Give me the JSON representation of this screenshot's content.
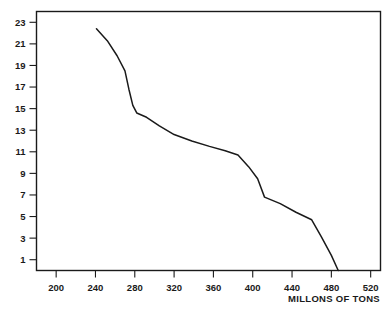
{
  "chart_data": {
    "type": "line",
    "title": "",
    "subtitle": "",
    "xlabel": "MILLONS OF TONS",
    "ylabel": "",
    "xlim": [
      180,
      530
    ],
    "ylim": [
      0,
      24
    ],
    "grid": false,
    "legend": null,
    "x_ticks": [
      200,
      240,
      280,
      320,
      360,
      400,
      440,
      480,
      520
    ],
    "x_tick_labels": [
      "200",
      "240",
      "280",
      "320",
      "360",
      "400",
      "440",
      "480",
      "520"
    ],
    "y_ticks": [
      23,
      21,
      19,
      17,
      15,
      13,
      11,
      9,
      7,
      5,
      3,
      1
    ],
    "y_tick_labels": [
      "23",
      "21",
      "19",
      "17",
      "15",
      "13",
      "11",
      "9",
      "7",
      "5",
      "3",
      "1"
    ],
    "series": [
      {
        "name": "curve",
        "color": "#1a1a1a",
        "points": [
          [
            241,
            22.4
          ],
          [
            252,
            21.3
          ],
          [
            262,
            19.9
          ],
          [
            270,
            18.5
          ],
          [
            274,
            16.8
          ],
          [
            278,
            15.3
          ],
          [
            282,
            14.6
          ],
          [
            292,
            14.2
          ],
          [
            305,
            13.4
          ],
          [
            320,
            12.6
          ],
          [
            338,
            12.0
          ],
          [
            356,
            11.5
          ],
          [
            372,
            11.1
          ],
          [
            385,
            10.7
          ],
          [
            396,
            9.6
          ],
          [
            405,
            8.5
          ],
          [
            412,
            6.8
          ],
          [
            428,
            6.2
          ],
          [
            444,
            5.4
          ],
          [
            460,
            4.7
          ],
          [
            470,
            3.1
          ],
          [
            480,
            1.4
          ],
          [
            487,
            0.0
          ]
        ]
      }
    ]
  },
  "colors": {
    "line": "#1a1a1a",
    "frame": "#1a1a1a",
    "background": "#ffffff",
    "text": "#1a1a1a"
  }
}
